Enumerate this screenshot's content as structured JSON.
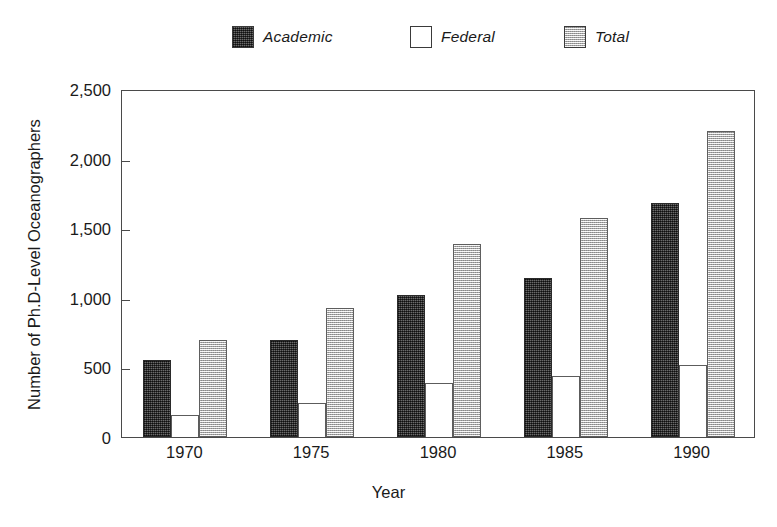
{
  "chart_data": {
    "type": "bar",
    "title": "",
    "xlabel": "Year",
    "ylabel": "Number of Ph.D-Level Oceanographers",
    "categories": [
      "1970",
      "1975",
      "1980",
      "1985",
      "1990"
    ],
    "series": [
      {
        "name": "Academic",
        "values": [
          550,
          700,
          1020,
          1140,
          1680
        ],
        "swatch": "academic",
        "color": "#434343"
      },
      {
        "name": "Federal",
        "values": [
          160,
          245,
          390,
          440,
          515
        ],
        "swatch": "federal",
        "color": "#ffffff"
      },
      {
        "name": "Total",
        "values": [
          695,
          925,
          1390,
          1570,
          2200
        ],
        "swatch": "total",
        "color": "#c8c8c8"
      }
    ],
    "ylim": [
      0,
      2500
    ],
    "yticks": [
      0,
      500,
      1000,
      1500,
      2000,
      2500
    ],
    "ytick_labels": [
      "0",
      "500",
      "1,000",
      "1,500",
      "2,000",
      "2,500"
    ],
    "grid": false,
    "legend_position": "top-center",
    "axis_color": "#4a4a4a"
  },
  "legend": {
    "items": [
      {
        "label": "Academic",
        "swatch": "academic",
        "x": 232
      },
      {
        "label": "Federal",
        "swatch": "federal",
        "x": 410
      },
      {
        "label": "Total",
        "swatch": "total",
        "x": 564
      }
    ]
  }
}
